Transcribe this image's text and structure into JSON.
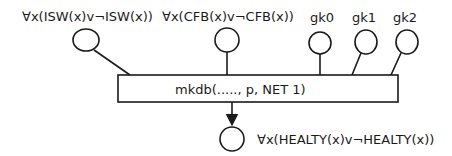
{
  "diagram": {
    "inputs": [
      {
        "id": "isw",
        "label": "∀x(ISW(x)v¬ISW(x))"
      },
      {
        "id": "cfb",
        "label": "∀x(CFB(x)v¬CFB(x))"
      },
      {
        "id": "gk0",
        "label": "gk0"
      },
      {
        "id": "gk1",
        "label": "gk1"
      },
      {
        "id": "gk2",
        "label": "gk2"
      }
    ],
    "process": {
      "label": "mkdb(....., p, NET 1)"
    },
    "output": {
      "id": "healty",
      "label": "∀x(HEALTY(x)v¬HEALTY(x))"
    }
  }
}
